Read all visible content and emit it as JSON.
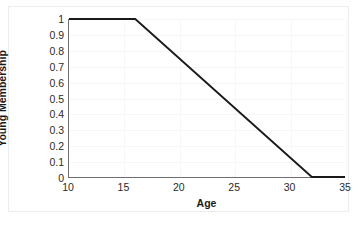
{
  "chart_data": {
    "type": "line",
    "title": "",
    "subtitle": "",
    "xlabel": "Age",
    "ylabel": "Young Membership",
    "xlim": [
      10,
      35
    ],
    "ylim": [
      0,
      1
    ],
    "grid": true,
    "legend": "none",
    "xticks": [
      "10",
      "15",
      "20",
      "25",
      "30",
      "35"
    ],
    "xtick_values": [
      10,
      15,
      20,
      25,
      30,
      35
    ],
    "yticks": [
      "0",
      "0.1",
      "0.2",
      "0.3",
      "0.4",
      "0.5",
      "0.6",
      "0.7",
      "0.8",
      "0.9",
      "1"
    ],
    "ytick_values": [
      0,
      0.1,
      0.2,
      0.3,
      0.4,
      0.5,
      0.6,
      0.7,
      0.8,
      0.9,
      1
    ],
    "series": [
      {
        "name": "Young",
        "color": "#1a1a1a",
        "x": [
          10,
          16,
          32,
          35
        ],
        "values": [
          1,
          1,
          0,
          0
        ],
        "points": [
          {
            "x": 10,
            "y": 1
          },
          {
            "x": 16,
            "y": 1
          },
          {
            "x": 32,
            "y": 0
          },
          {
            "x": 35,
            "y": 0
          }
        ]
      }
    ],
    "annotations": []
  },
  "figure": {
    "axis_color": "#6f6f6f",
    "grid_color": "#f7f7f7",
    "line_color": "#1a1a1a",
    "background": "#ffffff",
    "border_color": "#ececec"
  }
}
